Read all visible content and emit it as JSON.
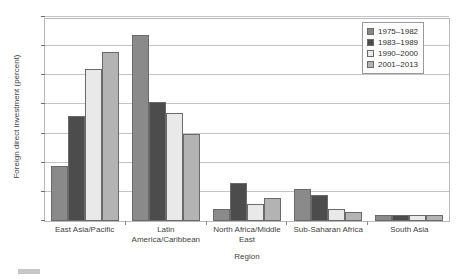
{
  "chart_data": {
    "type": "bar",
    "title": "",
    "xlabel": "Region",
    "ylabel": "Foreign direct investment (percent)",
    "ylim": [
      0,
      70
    ],
    "ytick_step": 10,
    "yticks": [
      "0",
      "10",
      "20",
      "30",
      "40",
      "50",
      "60",
      "70"
    ],
    "grid": true,
    "legend_position": "top-right",
    "categories": [
      "East Asia/Pacific",
      "Latin America/Caribbean",
      "North Africa/Middle East",
      "Sub-Saharan Africa",
      "South Asia"
    ],
    "category_lines": [
      [
        "East Asia/Pacific"
      ],
      [
        "Latin",
        "America/Caribbean"
      ],
      [
        "North Africa/Middle",
        "East"
      ],
      [
        "Sub-Saharan Africa"
      ],
      [
        "South Asia"
      ]
    ],
    "series": [
      {
        "name": "1975–1982",
        "color": "#8a8a8a",
        "values": [
          19,
          64,
          4,
          11,
          2
        ]
      },
      {
        "name": "1983–1989",
        "color": "#4c4c4c",
        "values": [
          36,
          41,
          13,
          9,
          2
        ]
      },
      {
        "name": "1990–2000",
        "color": "#e9e9e9",
        "values": [
          52,
          37,
          6,
          4,
          2
        ]
      },
      {
        "name": "2001–2013",
        "color": "#b3b3b3",
        "values": [
          58,
          30,
          8,
          3,
          2
        ]
      }
    ]
  }
}
